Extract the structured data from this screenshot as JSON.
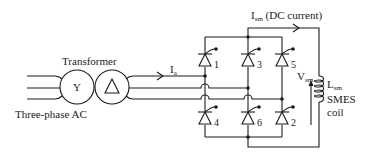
{
  "diagram": {
    "source": {
      "label": "Three-phase AC"
    },
    "transformer": {
      "label": "Transformer",
      "primary_symbol": "Y",
      "secondary_symbol": "△"
    },
    "ac_current": {
      "main": "I",
      "sub": "a"
    },
    "dc_current": {
      "main": "I",
      "sub": "sm",
      "suffix": " (DC current)"
    },
    "bridge": {
      "thyristors": [
        {
          "id": "1",
          "position": "upper-left"
        },
        {
          "id": "3",
          "position": "upper-middle"
        },
        {
          "id": "5",
          "position": "upper-right"
        },
        {
          "id": "4",
          "position": "lower-left"
        },
        {
          "id": "6",
          "position": "lower-middle"
        },
        {
          "id": "2",
          "position": "lower-right"
        }
      ]
    },
    "voltage": {
      "main": "V",
      "sub": "sm"
    },
    "inductor": {
      "main": "L",
      "sub": "sm"
    },
    "coil": {
      "line1": "SMES",
      "line2": "coil"
    },
    "colors": {
      "stroke": "#1a1a1a",
      "background": "#ffffff"
    }
  }
}
